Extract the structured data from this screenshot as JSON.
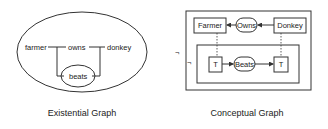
{
  "existential_graph": {
    "caption": "Existential Graph",
    "nodes": {
      "farmer": "farmer",
      "owns": "owns",
      "donkey": "donkey",
      "beats": "beats"
    }
  },
  "conceptual_graph": {
    "caption": "Conceptual Graph",
    "negation_outer": "¬",
    "negation_inner": "¬",
    "concepts": {
      "farmer": "Farmer",
      "donkey": "Donkey",
      "t_left": "T",
      "t_right": "T"
    },
    "relations": {
      "owns": "Owns",
      "beats": "Beats"
    }
  },
  "colors": {
    "ink": "#333333",
    "background": "#ffffff"
  }
}
